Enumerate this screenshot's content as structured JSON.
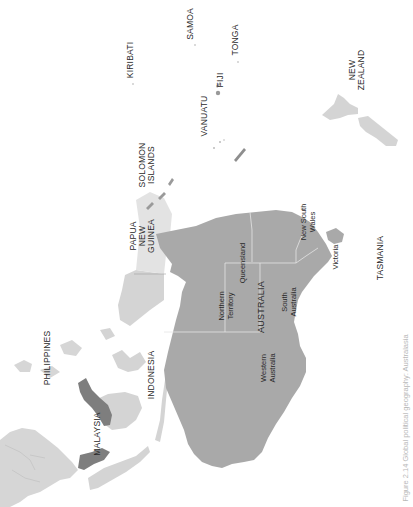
{
  "figure": {
    "caption": "Figure 2.14 Global political geography: Australasia",
    "orientation": "rotated-90-ccw"
  },
  "colors": {
    "background": "#ffffff",
    "australia": "#a9a9a9",
    "neighbors_light": "#d4d4d4",
    "malaysia_dark": "#7e7e7e",
    "borders": "#e6e6e6",
    "label_text": "#2a2a2a",
    "caption_text": "#b8b8b8"
  },
  "labels": {
    "samoa": "SAMOA",
    "kiribati": "KIRIBATI",
    "tonga": "TONGA",
    "fiji": "FIJI",
    "vanuatu": "VANUATU",
    "new_zealand": "NEW\nZEALAND",
    "solomon_islands": "SOLOMON\nISLANDS",
    "papua_new_guinea": "PAPUA\nNEW\nGUINEA",
    "tasmania": "TASMANIA",
    "philippines": "PHILIPPINES",
    "indonesia": "INDONESIA",
    "malaysia": "MALAYSIA",
    "australia": "AUSTRALIA"
  },
  "states": {
    "queensland": "Queensland",
    "new_south_wales": "New South\nWales",
    "victoria": "Victoria",
    "northern_territory": "Northern\nTerritory",
    "south_australia": "South\nAustralia",
    "western_australia": "Western\nAustralia"
  }
}
